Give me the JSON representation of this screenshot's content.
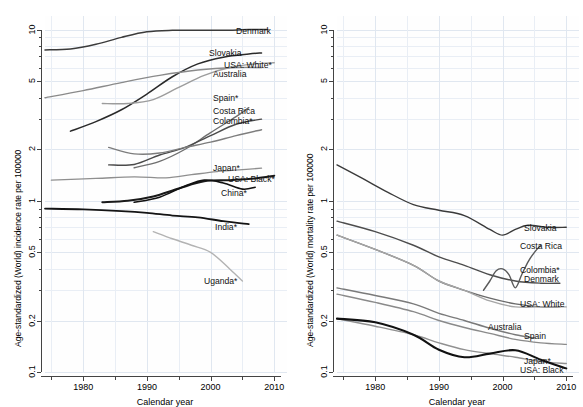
{
  "figure": {
    "panels": [
      {
        "id": "incidence",
        "ylabel": "Age-standardized (World) incidence rate per 100000",
        "xlabel": "Calendar year"
      },
      {
        "id": "mortality",
        "ylabel": "Age-standardized (World) mortality rate per 100000",
        "xlabel": "Calendar year"
      }
    ]
  },
  "chart_data": [
    {
      "type": "line",
      "title": "",
      "xlabel": "Calendar year",
      "ylabel": "Age-standardized (World) incidence rate per 100000",
      "yscale": "log",
      "ylim": [
        0.1,
        12
      ],
      "xlim": [
        1974,
        2012
      ],
      "yticks": [
        0.1,
        0.2,
        0.5,
        1,
        2,
        5,
        10
      ],
      "ytick_labels": [
        "0.1",
        "0.2",
        "0.5",
        "1",
        "2",
        "5",
        "10"
      ],
      "xticks": [
        1980,
        1990,
        2000,
        2010
      ],
      "xtick_labels": [
        "1980",
        "1990",
        "2000",
        "2010"
      ],
      "grid": true,
      "legend": "inline-right-labels",
      "series": [
        {
          "name": "Denmark",
          "label": "Denmark",
          "color": "#3b3b3b",
          "width": 1.5,
          "x": [
            1974,
            1978,
            1982,
            1986,
            1990,
            1994,
            1998,
            2002,
            2006,
            2009
          ],
          "values": [
            7.6,
            7.7,
            8.2,
            9.0,
            9.7,
            9.9,
            9.9,
            9.9,
            10.0,
            10.0
          ]
        },
        {
          "name": "Slovakia",
          "label": "Slovakia",
          "color": "#2a2a2a",
          "width": 1.5,
          "x": [
            1978,
            1982,
            1986,
            1990,
            1994,
            1998,
            2002,
            2006,
            2008
          ],
          "values": [
            2.55,
            2.9,
            3.4,
            4.2,
            5.3,
            6.3,
            6.9,
            7.2,
            7.3
          ]
        },
        {
          "name": "USA: White",
          "label": "USA: White*",
          "color": "#9c9c9c",
          "width": 1.4,
          "x": [
            1983,
            1987,
            1991,
            1995,
            1999,
            2003,
            2007,
            2010
          ],
          "values": [
            3.7,
            3.7,
            3.9,
            4.6,
            5.4,
            6.0,
            6.3,
            6.4
          ]
        },
        {
          "name": "Australia",
          "label": "Australia",
          "color": "#8a8a8a",
          "width": 1.4,
          "x": [
            1974,
            1980,
            1986,
            1992,
            1998,
            2004,
            2008
          ],
          "values": [
            4.0,
            4.4,
            4.9,
            5.4,
            5.8,
            6.0,
            6.0
          ]
        },
        {
          "name": "Spain",
          "label": "Spain*",
          "color": "#6e6e6e",
          "width": 1.4,
          "x": [
            1988,
            1992,
            1996,
            2000,
            2004,
            2006
          ],
          "values": [
            1.56,
            1.7,
            2.0,
            2.5,
            3.1,
            3.5
          ]
        },
        {
          "name": "Costa Rica",
          "label": "Costa Rica",
          "color": "#4a4a4a",
          "width": 1.4,
          "x": [
            1984,
            1988,
            1992,
            1996,
            2000,
            2004,
            2008
          ],
          "values": [
            1.62,
            1.63,
            1.85,
            2.05,
            2.4,
            2.8,
            3.0
          ]
        },
        {
          "name": "Colombia",
          "label": "Colombia*",
          "color": "#7d7d7d",
          "width": 1.4,
          "x": [
            1984,
            1988,
            1992,
            1996,
            2000,
            2004,
            2008
          ],
          "values": [
            2.05,
            1.88,
            1.9,
            2.05,
            2.2,
            2.4,
            2.6
          ]
        },
        {
          "name": "Japan",
          "label": "Japan*",
          "color": "#8f8f8f",
          "width": 1.3,
          "x": [
            1975,
            1982,
            1988,
            1993,
            1997,
            2001,
            2005,
            2008
          ],
          "values": [
            1.32,
            1.35,
            1.38,
            1.36,
            1.42,
            1.48,
            1.52,
            1.55
          ]
        },
        {
          "name": "USA: Black",
          "label": "USA: Black*",
          "color": "#1a1a1a",
          "width": 2.0,
          "x": [
            1983,
            1987,
            1991,
            1995,
            1999,
            2003,
            2007,
            2010
          ],
          "values": [
            0.98,
            1.0,
            1.06,
            1.18,
            1.3,
            1.32,
            1.35,
            1.4
          ]
        },
        {
          "name": "China",
          "label": "China*",
          "color": "#111111",
          "width": 1.6,
          "x": [
            1988,
            1992,
            1996,
            1999,
            2002,
            2005,
            2007
          ],
          "values": [
            0.98,
            1.05,
            1.22,
            1.32,
            1.27,
            1.17,
            1.2
          ]
        },
        {
          "name": "India",
          "label": "India*",
          "color": "#141414",
          "width": 1.8,
          "x": [
            1974,
            1980,
            1986,
            1990,
            1994,
            1998,
            2002,
            2006
          ],
          "values": [
            0.9,
            0.89,
            0.87,
            0.85,
            0.82,
            0.8,
            0.76,
            0.73
          ]
        },
        {
          "name": "Uganda",
          "label": "Uganda*",
          "color": "#b3b3b3",
          "width": 1.4,
          "x": [
            1991,
            1994,
            1997,
            2000,
            2003,
            2005
          ],
          "values": [
            0.66,
            0.6,
            0.55,
            0.5,
            0.4,
            0.34
          ]
        }
      ],
      "labels": [
        {
          "text": "Denmark",
          "x": 236,
          "y": 27
        },
        {
          "text": "Slovakia",
          "x": 209,
          "y": 49
        },
        {
          "text": "USA: White*",
          "x": 224,
          "y": 61
        },
        {
          "text": "Australia",
          "x": 213,
          "y": 70
        },
        {
          "text": "Spain*",
          "x": 213,
          "y": 94
        },
        {
          "text": "Costa Rica",
          "x": 213,
          "y": 107
        },
        {
          "text": "Colombia*",
          "x": 213,
          "y": 117
        },
        {
          "text": "Japan*",
          "x": 213,
          "y": 164
        },
        {
          "text": "USA: Black*",
          "x": 228,
          "y": 175
        },
        {
          "text": "China*",
          "x": 221,
          "y": 189
        },
        {
          "text": "India*",
          "x": 215,
          "y": 223
        },
        {
          "text": "Uganda*",
          "x": 204,
          "y": 277
        }
      ]
    },
    {
      "type": "line",
      "title": "",
      "xlabel": "Calendar year",
      "ylabel": "Age-standardized (World) mortality rate per 100000",
      "yscale": "log",
      "ylim": [
        0.1,
        12
      ],
      "xlim": [
        1974,
        2012
      ],
      "yticks": [
        0.1,
        0.2,
        0.5,
        1,
        2,
        5,
        10
      ],
      "ytick_labels": [
        "0.1",
        "0.2",
        "0.5",
        "1",
        "2",
        "5",
        "10"
      ],
      "xticks": [
        1980,
        1990,
        2000,
        2010
      ],
      "xtick_labels": [
        "1980",
        "1990",
        "2000",
        "2010"
      ],
      "grid": true,
      "legend": "inline-right-labels",
      "series": [
        {
          "name": "Slovakia",
          "label": "Slovakia",
          "color": "#3a3a3a",
          "width": 1.4,
          "x": [
            1974,
            1978,
            1982,
            1986,
            1990,
            1994,
            1998,
            2000,
            2002,
            2004,
            2007,
            2010
          ],
          "values": [
            1.62,
            1.35,
            1.12,
            0.95,
            0.88,
            0.82,
            0.68,
            0.63,
            0.68,
            0.72,
            0.7,
            0.7
          ]
        },
        {
          "name": "Costa Rica",
          "label": "Costa Rica",
          "color": "#4d4d4d",
          "width": 1.4,
          "x": [
            1974,
            1980,
            1986,
            1990,
            1994,
            1998,
            2002,
            2006,
            2009
          ],
          "values": [
            0.76,
            0.66,
            0.55,
            0.47,
            0.42,
            0.37,
            0.34,
            0.33,
            0.33
          ]
        },
        {
          "name": "Colombia",
          "label": "Colombia*",
          "color": "#5a5a5a",
          "width": 1.4,
          "x": [
            1997,
            1998,
            1999,
            2000,
            2001,
            2002,
            2003,
            2004,
            2005,
            2006
          ],
          "values": [
            0.3,
            0.34,
            0.39,
            0.4,
            0.37,
            0.31,
            0.37,
            0.44,
            0.5,
            0.55
          ]
        },
        {
          "name": "Denmark",
          "label": "Denmark",
          "color": "#6a6a6a",
          "width": 1.4,
          "x": [
            1974,
            1980,
            1986,
            1990,
            1994,
            1998,
            2002,
            2006,
            2009
          ],
          "values": [
            0.63,
            0.52,
            0.42,
            0.34,
            0.3,
            0.27,
            0.25,
            0.24,
            0.24
          ]
        },
        {
          "name": "USA: White",
          "label": "USA: White",
          "color": "#a6a6a6",
          "width": 1.4,
          "x": [
            1974,
            1980,
            1986,
            1990,
            1994,
            1998,
            2002,
            2006,
            2010
          ],
          "values": [
            0.63,
            0.52,
            0.42,
            0.34,
            0.3,
            0.26,
            0.24,
            0.24,
            0.24
          ]
        },
        {
          "name": "Australia",
          "label": "Australia",
          "color": "#7a7a7a",
          "width": 1.4,
          "x": [
            1974,
            1980,
            1986,
            1990,
            1994,
            1998,
            2002,
            2005
          ],
          "values": [
            0.31,
            0.28,
            0.25,
            0.22,
            0.2,
            0.18,
            0.165,
            0.158
          ]
        },
        {
          "name": "Spain",
          "label": "Spain",
          "color": "#8a8a8a",
          "width": 1.4,
          "x": [
            1974,
            1980,
            1986,
            1990,
            1994,
            1998,
            2002,
            2006,
            2010
          ],
          "values": [
            0.285,
            0.255,
            0.225,
            0.2,
            0.182,
            0.168,
            0.155,
            0.148,
            0.145
          ]
        },
        {
          "name": "Japan",
          "label": "Japan*",
          "color": "#909090",
          "width": 1.4,
          "x": [
            1974,
            1980,
            1986,
            1990,
            1994,
            1998,
            2002,
            2006,
            2010
          ],
          "values": [
            0.205,
            0.185,
            0.165,
            0.148,
            0.135,
            0.128,
            0.122,
            0.115,
            0.112
          ]
        },
        {
          "name": "USA: Black",
          "label": "USA: Black",
          "color": "#111111",
          "width": 2.1,
          "x": [
            1974,
            1980,
            1986,
            1990,
            1994,
            1998,
            2002,
            2006,
            2010
          ],
          "values": [
            0.205,
            0.195,
            0.165,
            0.135,
            0.122,
            0.128,
            0.134,
            0.118,
            0.105
          ]
        }
      ],
      "labels": [
        {
          "text": "Slovakia",
          "x": 232,
          "y": 224
        },
        {
          "text": "Costa Rica",
          "x": 228,
          "y": 242
        },
        {
          "text": "Colombia*",
          "x": 228,
          "y": 266
        },
        {
          "text": "Denmark",
          "x": 232,
          "y": 275
        },
        {
          "text": "USA: White",
          "x": 228,
          "y": 300
        },
        {
          "text": "Australia",
          "x": 196,
          "y": 323
        },
        {
          "text": "Spain",
          "x": 232,
          "y": 332
        },
        {
          "text": "Japan*",
          "x": 232,
          "y": 357
        },
        {
          "text": "USA: Black",
          "x": 228,
          "y": 366
        }
      ]
    }
  ]
}
